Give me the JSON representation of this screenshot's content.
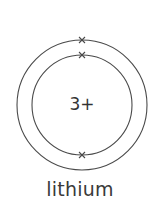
{
  "diagram": {
    "element_name": "lithium",
    "nucleus_charge": "3+",
    "shells": [
      {
        "index": 1,
        "electrons": 2,
        "marker": "x"
      },
      {
        "index": 2,
        "electrons": 1,
        "marker": "x"
      }
    ],
    "colors": {
      "stroke": "#4a4a4a",
      "text": "#333333",
      "background": "#ffffff"
    }
  }
}
